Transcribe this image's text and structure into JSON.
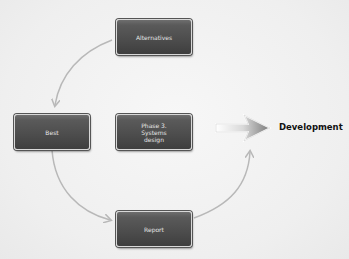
{
  "diagram": {
    "center": {
      "line1": "Phase 3.",
      "line2": "Systems",
      "line3": "design"
    },
    "nodes": {
      "alternatives": "Alternatives",
      "best": "Best",
      "report": "Report"
    },
    "outcome": "Development",
    "cycle_order": [
      "Alternatives",
      "Best",
      "Report",
      "Development"
    ],
    "colors": {
      "box_fill": "#4c4c4c",
      "box_text": "#e6e6e6",
      "connector": "#b8b8b8",
      "arrow": "#7a7a7a",
      "background": "#f0f0f0"
    }
  }
}
